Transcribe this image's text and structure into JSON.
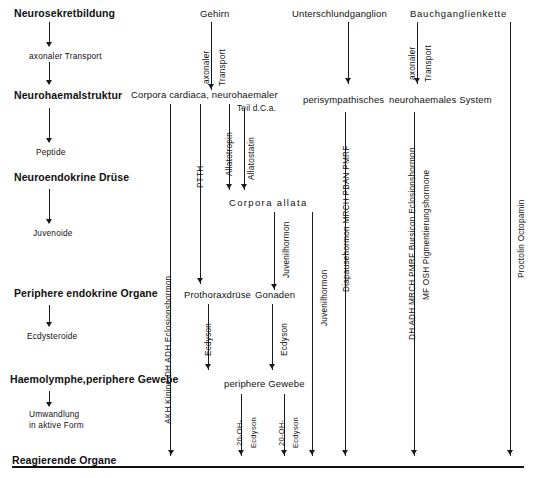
{
  "diagram": {
    "language": "de",
    "ink_color": "#1a1a1a",
    "background": "#ffffff"
  },
  "left_column": {
    "rows": [
      {
        "label": "Neurosekretbildung",
        "kind": "major"
      },
      {
        "label": "axonaler Transport",
        "kind": "small"
      },
      {
        "label": "Neurohaemalstruktur",
        "kind": "major"
      },
      {
        "label": "Peptide",
        "kind": "small"
      },
      {
        "label": "Neuroendokrine Drüse",
        "kind": "major"
      },
      {
        "label": "Juvenoide",
        "kind": "small"
      },
      {
        "label": "Periphere endokrine Organe",
        "kind": "major"
      },
      {
        "label": "Ecdysteroide",
        "kind": "small"
      },
      {
        "label": "Haemolymphe,periphere Gewebe",
        "kind": "major"
      },
      {
        "label": "Umwandlung",
        "kind": "small"
      },
      {
        "label": "in aktive Form",
        "kind": "small"
      },
      {
        "label": "Reagierende Organe",
        "kind": "major"
      }
    ]
  },
  "top_sources": [
    {
      "label": "Neurosekretbildung"
    },
    {
      "label": "Gehirn"
    },
    {
      "label": "Unterschlundganglion"
    },
    {
      "label": "Bauchganglienkette"
    }
  ],
  "neurohaemal_row": [
    {
      "label": "Neurohaemalstruktur"
    },
    {
      "label": "Corpora cardiaca, neurohaemaler"
    },
    {
      "label": "Teil d.C.a."
    },
    {
      "label": "perisympathisches"
    },
    {
      "label": "neurohaemales System"
    }
  ],
  "glands": [
    {
      "label": "Corpora allata"
    },
    {
      "label": "Prothoraxdrüse"
    },
    {
      "label": "Gonaden"
    },
    {
      "label": "periphere Gewebe"
    }
  ],
  "transport_labels": [
    {
      "label": "axonaler",
      "at": "gehirn"
    },
    {
      "label": "Transport",
      "at": "gehirn"
    },
    {
      "label": "axonaler",
      "at": "bauchganglienkette"
    },
    {
      "label": "Transport",
      "at": "bauchganglienkette"
    }
  ],
  "vertical_labels": [
    {
      "label": "AKH Kinine DH ADH  Eclosionshormon"
    },
    {
      "label": "PTTH"
    },
    {
      "label": "Allatotropin"
    },
    {
      "label": "Allatostatin"
    },
    {
      "label": "Juvenilhormon"
    },
    {
      "label": "Ecdyson"
    },
    {
      "label": "Ecdyson"
    },
    {
      "label": "Juvenilhormon"
    },
    {
      "label": "20-OH-"
    },
    {
      "label": "Ecdyson"
    },
    {
      "label": "20-OH-"
    },
    {
      "label": "Ecdyson"
    },
    {
      "label": "Diapausehormon  MRCH  PBAN  PMRF"
    },
    {
      "label": "DH ADH MRCH PMRF Bursicon Eclosionshormon"
    },
    {
      "label": "MF  OSH  Pigmentierungshormone"
    },
    {
      "label": "Proctolin Octopamin"
    }
  ],
  "footer": {
    "label": "Reagierende Organe"
  }
}
